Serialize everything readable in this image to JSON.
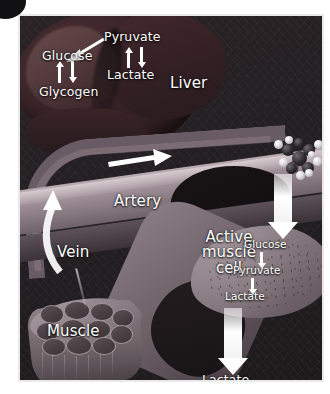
{
  "figure": {
    "accent_white": "#ffffff",
    "panel_border": "#e9e9ea",
    "background": "#211d1f"
  },
  "corner_badge": {
    "name": "corner-badge"
  },
  "organs": {
    "liver": {
      "label": "Liver"
    },
    "artery": {
      "label": "Artery"
    },
    "vein": {
      "label": "Vein"
    },
    "muscle": {
      "label": "Muscle"
    },
    "active_muscle_cell": {
      "line1": "Active",
      "line2": "muscle",
      "line3": "cell"
    }
  },
  "liver_pathway": {
    "glucose": "Glucose",
    "glycogen": "Glycogen",
    "pyruvate": "Pyruvate",
    "lactate": "Lactate",
    "arrows": {
      "glucose_glycogen": "bidirectional-vertical",
      "pyruvate_lactate": "bidirectional-vertical",
      "pyruvate_to_glucose": "diagonal-down-left"
    }
  },
  "muscle_pathway": {
    "glucose": "Glucose",
    "pyruvate": "Pyruvate",
    "lactate": "Lactate",
    "arrows": {
      "glucose_to_pyruvate": "down",
      "pyruvate_to_lactate": "down"
    }
  },
  "transport": {
    "glucose_delivery_arrow": "down",
    "lactate_release_arrow": "down",
    "lactate_output_label": "Lactate",
    "arterial_flow_arrow": "right",
    "venous_return_arrow": "up-curved"
  },
  "molecule": {
    "name": "glucose-molecule-model",
    "atom_dark_color": "#2b282c",
    "atom_light_color": "#ffffff"
  }
}
